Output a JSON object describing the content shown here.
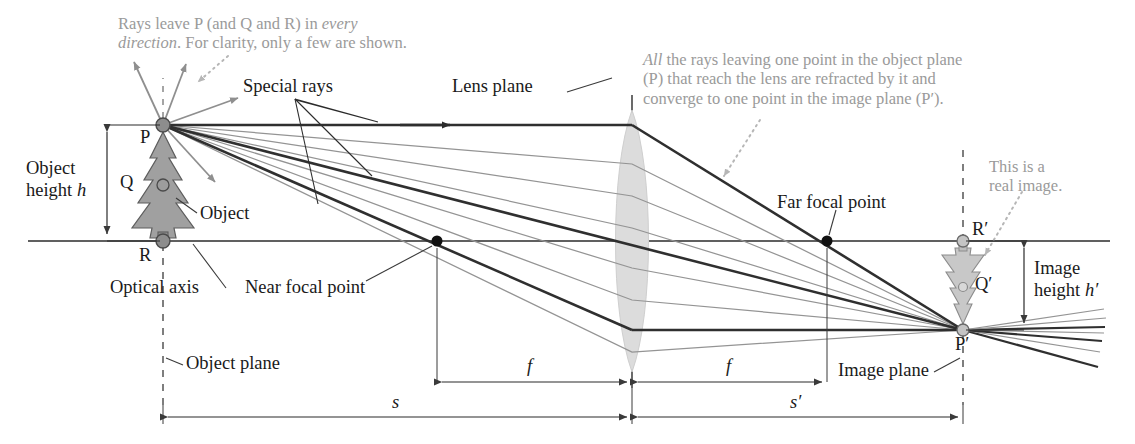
{
  "figure": {
    "type": "optics-ray-diagram"
  },
  "annotations": {
    "rays_every_direction": {
      "line1_plain": "Rays leave P (and Q and R) in ",
      "line1_italic": "every",
      "line2_italic": "direction",
      "line2_plain": ". For clarity, only a few are shown."
    },
    "all_rays_converge": {
      "line1_italic": "All",
      "line1_plain": " the rays leaving one point in the object plane",
      "line2": "(P) that reach the lens are refracted by it and",
      "line3": "converge to one point in the image plane (P′)."
    },
    "real_image": {
      "line1": "This is a",
      "line2": "real image."
    }
  },
  "labels": {
    "special_rays": "Special rays",
    "lens_plane": "Lens plane",
    "object_height_line1": "Object",
    "object_height_line2_plain": "height ",
    "object_height_line2_italic": "h",
    "image_height_line1": "Image",
    "image_height_line2_plain": "height ",
    "image_height_line2_italic": "h′",
    "object": "Object",
    "optical_axis": "Optical axis",
    "object_plane": "Object plane",
    "image_plane": "Image plane",
    "near_focal_point": "Near focal point",
    "far_focal_point": "Far focal point",
    "point_P": "P",
    "point_Q": "Q",
    "point_R": "R",
    "point_P_prime": "P′",
    "point_Q_prime": "Q′",
    "point_R_prime": "R′",
    "focal_left": "f",
    "focal_right": "f",
    "object_distance": "s",
    "image_distance": "s′"
  },
  "geometry": {
    "optical_axis_y": 241,
    "lens_center_x": 632,
    "object_plane_x": 163,
    "image_plane_x": 963,
    "point_P": [
      163,
      125
    ],
    "point_Q": [
      163,
      185
    ],
    "point_R": [
      163,
      241
    ],
    "point_P_prime": [
      963,
      330
    ],
    "point_Q_prime": [
      963,
      287
    ],
    "point_R_prime": [
      963,
      241
    ],
    "near_focal_point": [
      437,
      241
    ],
    "far_focal_point": [
      827,
      241
    ]
  },
  "colors": {
    "ink": "#1a1a1a",
    "gray_text": "#9a9a9a",
    "special_ray": "#3a3a3a",
    "ordinary_ray": "#8f8f8f",
    "lens_fill": "#dcdcdc",
    "object_fill": "#a3a3a3",
    "image_fill": "#c9c9c9",
    "node_fill": "#8a8a8a",
    "background": "#ffffff"
  }
}
